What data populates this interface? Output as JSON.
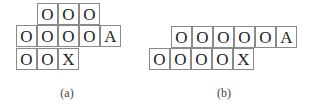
{
  "figures": [
    {
      "id": "a",
      "caption": "(a)",
      "caption_pos": [
        67,
        86
      ],
      "cell_size": [
        21,
        22
      ],
      "rows": [
        {
          "x": 37,
          "y": 3,
          "cells": [
            "O",
            "O",
            "O"
          ]
        },
        {
          "x": 16,
          "y": 25,
          "cells": [
            "O",
            "O",
            "O",
            "O",
            "A"
          ]
        },
        {
          "x": 16,
          "y": 48,
          "cells": [
            "O",
            "O",
            "X"
          ]
        }
      ]
    },
    {
      "id": "b",
      "caption": "(b)",
      "caption_pos": [
        224,
        86
      ],
      "cell_size": [
        21,
        22
      ],
      "rows": [
        {
          "x": 171,
          "y": 26,
          "cells": [
            "O",
            "O",
            "O",
            "O",
            "O",
            "A"
          ]
        },
        {
          "x": 149,
          "y": 48,
          "cells": [
            "O",
            "O",
            "O",
            "O",
            "X"
          ]
        }
      ]
    }
  ]
}
